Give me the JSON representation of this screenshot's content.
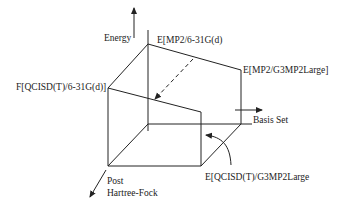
{
  "diagram": {
    "type": "3d-cube-diagram",
    "axes": {
      "vertical": "Energy",
      "horizontal": "Basis Set",
      "depth": [
        "Post",
        "Hartree-Fock"
      ]
    },
    "labels": {
      "top_back": "E[MP2/6-31G(d)",
      "top_right": "E[MP2/G3MP2Large]",
      "front_left": "F[QCISD(T)/6-31G(d)]",
      "bottom_right": "E[QCISD(T)/G3MP2Large"
    },
    "colors": {
      "line": "#222222",
      "background": "#ffffff"
    }
  }
}
